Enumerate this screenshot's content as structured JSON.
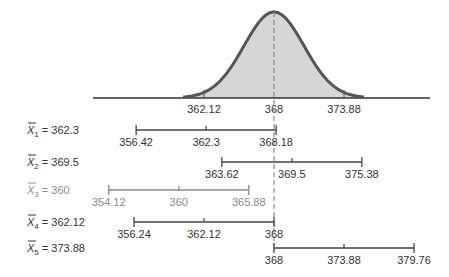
{
  "chart_data": {
    "type": "diagram",
    "title": "",
    "distribution": {
      "mean": 368,
      "mean_label": "368",
      "axis_ticks": [
        {
          "value": 362.12,
          "label": "362.12"
        },
        {
          "value": 368,
          "label": "368"
        },
        {
          "value": 373.88,
          "label": "373.88"
        }
      ],
      "axis_range": [
        360.4,
        376.2
      ],
      "shaded": true
    },
    "intervals": [
      {
        "name": "X̄",
        "sub": "1",
        "label_eq": " = 362.3",
        "mean": 362.3,
        "lower": 356.42,
        "upper": 368.18,
        "lower_label": "356.42",
        "mean_label": "362.3",
        "upper_label": "368.18",
        "contains_mu": true,
        "muted": false
      },
      {
        "name": "X̄",
        "sub": "2",
        "label_eq": " = 369.5",
        "mean": 369.5,
        "lower": 363.62,
        "upper": 375.38,
        "lower_label": "363.62",
        "mean_label": "369.5",
        "upper_label": "375.38",
        "contains_mu": true,
        "muted": false
      },
      {
        "name": "X̄",
        "sub": "3",
        "label_eq": " = 360",
        "mean": 360,
        "lower": 354.12,
        "upper": 365.88,
        "lower_label": "354.12",
        "mean_label": "360",
        "upper_label": "365.88",
        "contains_mu": false,
        "muted": true
      },
      {
        "name": "X̄",
        "sub": "4",
        "label_eq": " = 362.12",
        "mean": 362.12,
        "lower": 356.24,
        "upper": 368,
        "lower_label": "356.24",
        "mean_label": "362.12",
        "upper_label": "368",
        "contains_mu": true,
        "muted": false
      },
      {
        "name": "X̄",
        "sub": "5",
        "label_eq": " = 373.88",
        "mean": 373.88,
        "lower": 368,
        "upper": 379.76,
        "lower_label": "368",
        "mean_label": "373.88",
        "upper_label": "379.76",
        "contains_mu": true,
        "muted": false
      }
    ],
    "colors": {
      "curve": "#555555",
      "fill": "#d6d6d6",
      "axis": "#333333",
      "dash": "#8a8a8a",
      "interval": "#444444",
      "interval_muted": "#8a8a8a"
    }
  }
}
